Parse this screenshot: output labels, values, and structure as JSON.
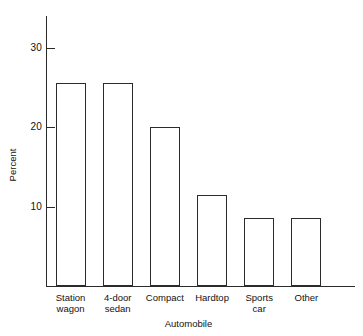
{
  "chart_data": {
    "type": "bar",
    "title": "",
    "xlabel": "Automobile",
    "ylabel": "Percent",
    "categories": [
      "Station wagon",
      "4-door sedan",
      "Compact",
      "Hardtop",
      "Sports car",
      "Other"
    ],
    "category_labels_multiline": [
      "Station\nwagon",
      "4-door\nsedan",
      "Compact",
      "Hardtop",
      "Sports\ncar",
      "Other"
    ],
    "values": [
      25.6,
      25.6,
      20.0,
      11.4,
      8.6,
      8.6
    ],
    "ylim": [
      0,
      34
    ],
    "yticks": [
      10,
      20,
      30
    ],
    "ytick_labels": [
      "10",
      "20",
      "30"
    ],
    "grid": false,
    "legend": null,
    "bar_fill": "#ffffff",
    "bar_edge": "#2b2b2b",
    "axis_color": "#2a2a2a",
    "background": "#ffffff"
  },
  "axes": {
    "y_title": "Percent",
    "x_title": "Automobile"
  }
}
